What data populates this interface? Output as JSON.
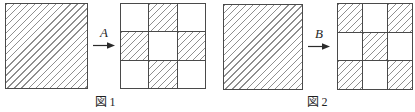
{
  "colors": {
    "background": "#ffffff",
    "line": "#4a4a4a",
    "hatch": "#8f8f8f",
    "arrow": "#2b2b2b",
    "text": "#1f1f1f"
  },
  "figures": [
    {
      "caption": "図 1",
      "arrow_label": "A",
      "source_square": {
        "hatched": true
      },
      "result_grid": {
        "rows": 3,
        "cols": 3,
        "pattern": [
          [
            0,
            1,
            0
          ],
          [
            1,
            0,
            1
          ],
          [
            0,
            1,
            0
          ]
        ]
      }
    },
    {
      "caption": "図 2",
      "arrow_label": "B",
      "source_square": {
        "hatched": true
      },
      "result_grid": {
        "rows": 3,
        "cols": 3,
        "pattern": [
          [
            1,
            0,
            1
          ],
          [
            0,
            1,
            0
          ],
          [
            1,
            0,
            1
          ]
        ]
      }
    }
  ]
}
